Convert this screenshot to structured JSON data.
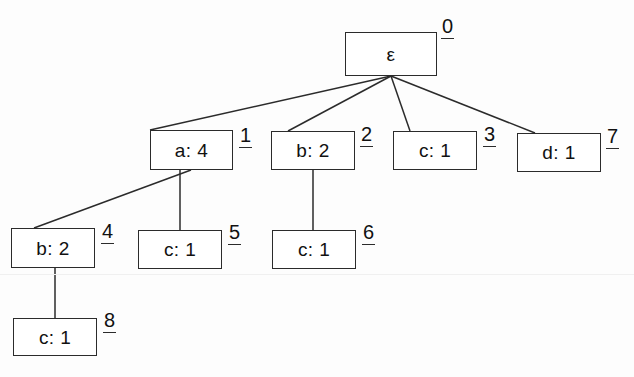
{
  "diagram": {
    "type": "tree",
    "stroke_color": "#2b2b2b",
    "text_color": "#111111",
    "background_color": "#fdfdfd",
    "nodes": [
      {
        "id": "0",
        "label": "ε",
        "x": 345,
        "y": 32,
        "w": 92,
        "h": 44,
        "id_x": 441,
        "id_y": 16
      },
      {
        "id": "1",
        "label": "a: 4",
        "x": 150,
        "y": 130,
        "w": 83,
        "h": 40,
        "id_x": 239,
        "id_y": 125
      },
      {
        "id": "2",
        "label": "b: 2",
        "x": 271,
        "y": 131,
        "w": 84,
        "h": 39,
        "id_x": 360,
        "id_y": 124
      },
      {
        "id": "3",
        "label": "c: 1",
        "x": 393,
        "y": 131,
        "w": 84,
        "h": 39,
        "id_x": 483,
        "id_y": 124
      },
      {
        "id": "7",
        "label": "d: 1",
        "x": 517,
        "y": 133,
        "w": 84,
        "h": 39,
        "id_x": 606,
        "id_y": 126
      },
      {
        "id": "4",
        "label": "b: 2",
        "x": 11,
        "y": 228,
        "w": 84,
        "h": 40,
        "id_x": 101,
        "id_y": 221
      },
      {
        "id": "5",
        "label": "c: 1",
        "x": 138,
        "y": 230,
        "w": 84,
        "h": 39,
        "id_x": 228,
        "id_y": 222
      },
      {
        "id": "6",
        "label": "c: 1",
        "x": 272,
        "y": 230,
        "w": 84,
        "h": 39,
        "id_x": 362,
        "id_y": 222
      },
      {
        "id": "8",
        "label": "c: 1",
        "x": 13,
        "y": 318,
        "w": 84,
        "h": 38,
        "id_x": 103,
        "id_y": 310
      }
    ],
    "edges": [
      {
        "from": "0",
        "to": "1",
        "x1": 391,
        "y1": 76,
        "x2": 150,
        "y2": 130
      },
      {
        "from": "0",
        "to": "2",
        "x1": 391,
        "y1": 76,
        "x2": 288,
        "y2": 131
      },
      {
        "from": "0",
        "to": "3",
        "x1": 391,
        "y1": 76,
        "x2": 410,
        "y2": 131
      },
      {
        "from": "0",
        "to": "7",
        "x1": 391,
        "y1": 76,
        "x2": 535,
        "y2": 133
      },
      {
        "from": "1",
        "to": "4",
        "x1": 191,
        "y1": 170,
        "x2": 34,
        "y2": 228
      },
      {
        "from": "1",
        "to": "5",
        "x1": 180,
        "y1": 170,
        "x2": 180,
        "y2": 230
      },
      {
        "from": "2",
        "to": "6",
        "x1": 313,
        "y1": 170,
        "x2": 313,
        "y2": 230
      },
      {
        "from": "4",
        "to": "8",
        "x1": 55,
        "y1": 268,
        "x2": 55,
        "y2": 318
      }
    ]
  }
}
